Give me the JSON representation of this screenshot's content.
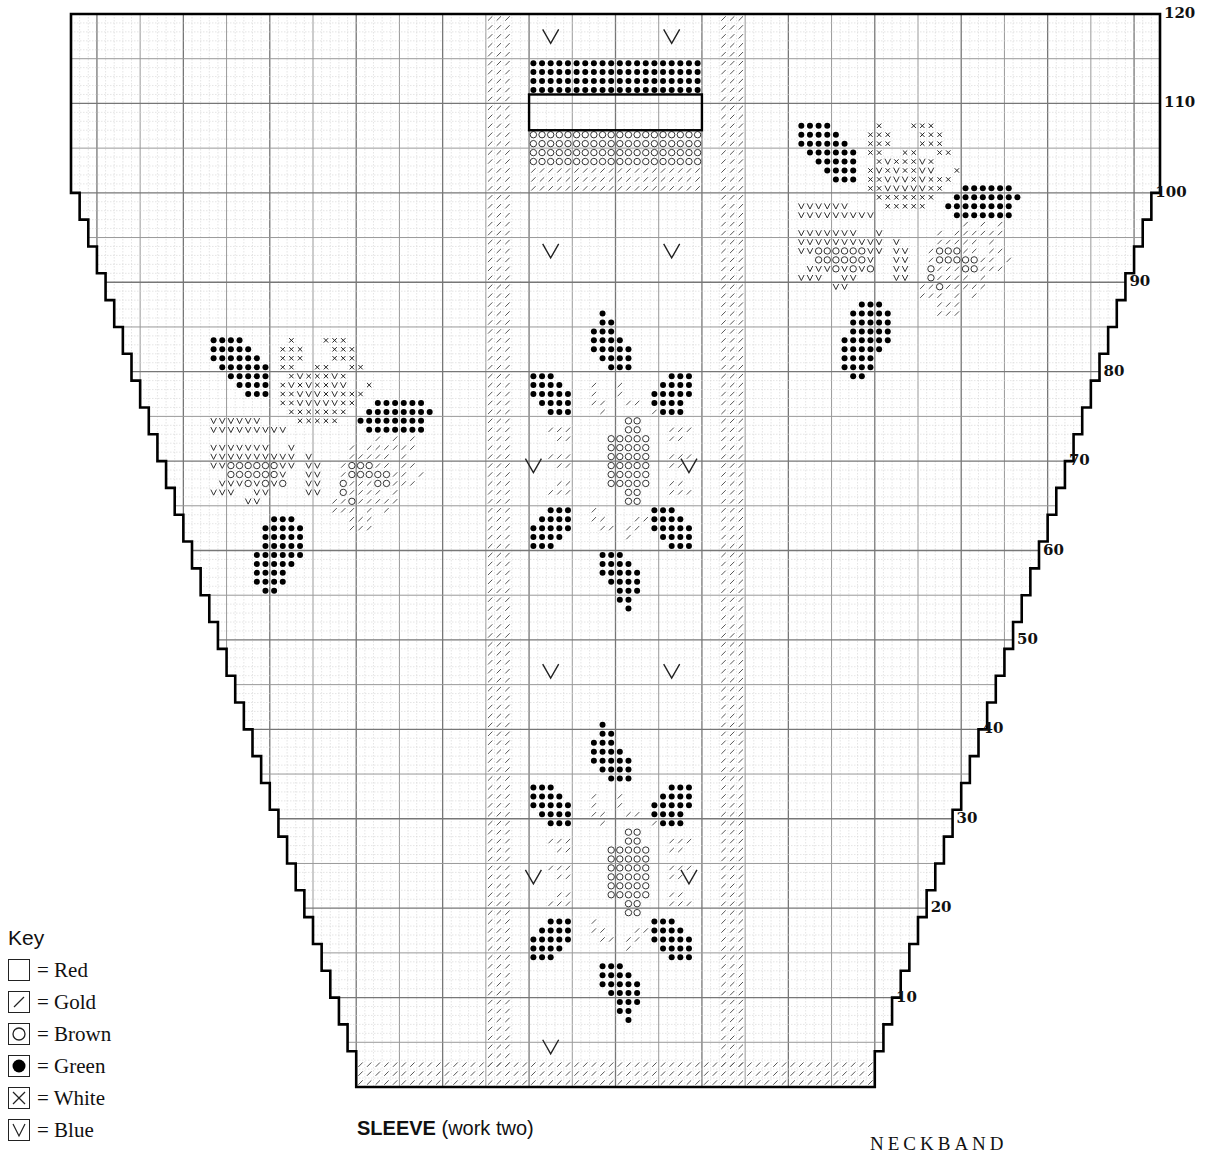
{
  "chart": {
    "title_bold": "SLEEVE",
    "title_rest": " (work two)",
    "next_section_label": "NECKBAND",
    "total_rows": 120,
    "row_labels": [
      "10",
      "20",
      "30",
      "40",
      "50",
      "60",
      "70",
      "80",
      "90",
      "100",
      "110",
      "120"
    ],
    "geometry": {
      "left": 71,
      "right": 1160,
      "top": 14,
      "bottom": 1087,
      "cols": 126,
      "rows": 120
    }
  },
  "key": {
    "title": "Key",
    "items": [
      {
        "symbol": "blank",
        "label": "= Red"
      },
      {
        "symbol": "slash",
        "label": "= Gold"
      },
      {
        "symbol": "circle",
        "label": "= Brown"
      },
      {
        "symbol": "dot",
        "label": "= Green"
      },
      {
        "symbol": "cross",
        "label": "= White"
      },
      {
        "symbol": "vee",
        "label": "= Blue"
      }
    ]
  },
  "chart_data": {
    "type": "table",
    "title": "SLEEVE (work two)",
    "row_axis": {
      "min": 0,
      "max": 120,
      "ticks": [
        10,
        20,
        30,
        40,
        50,
        60,
        70,
        80,
        90,
        100,
        110,
        120
      ]
    },
    "legend": [
      "Red (blank)",
      "Gold (/)",
      "Brown (o)",
      "Green (•)",
      "White (x)",
      "Blue (v)"
    ]
  }
}
